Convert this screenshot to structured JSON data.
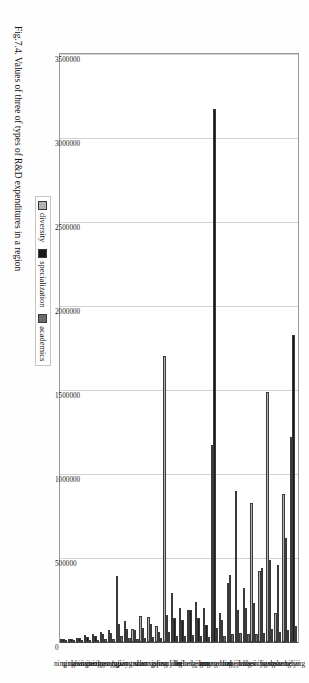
{
  "figure": {
    "caption": "Fig.7.4. Values of three of types of R&D expenditures in a region"
  },
  "legend": {
    "items": [
      {
        "label": "diversity",
        "color": "#b3b3b3"
      },
      {
        "label": "specialization",
        "color": "#1a1a1a"
      },
      {
        "label": "academics",
        "color": "#6b6b6b"
      }
    ]
  },
  "chart_data": {
    "type": "bar",
    "orientation": "horizontal",
    "title": "",
    "subtitle": "",
    "xlabel": "",
    "ylabel": "",
    "grid": true,
    "legend_position": "bottom-left",
    "xlim": [
      0,
      3500000
    ],
    "xticks": [
      "0",
      "500000",
      "1000000",
      "1500000",
      "2000000",
      "2500000",
      "3000000",
      "3500000"
    ],
    "xtick_values": [
      0,
      500000,
      1000000,
      1500000,
      2000000,
      2500000,
      3000000,
      3500000
    ],
    "categories": [
      "beijing",
      "shanghai",
      "shaanxi",
      "jiangsu",
      "sichuan",
      "liaoning",
      "hubei",
      "zhejiang",
      "tianjin",
      "anhui",
      "guangdong",
      "hunan",
      "henan",
      "heilongjiang",
      "hebei",
      "jilin",
      "shandong",
      "gansu",
      "chongqing",
      "shanxi",
      "yunnan",
      "jiangxi",
      "fujian",
      "guangxi",
      "neimenggu",
      "guizhou",
      "xinjiang",
      "hainan",
      "qinghai",
      "ningxia"
    ],
    "series": [
      {
        "name": "diversity",
        "color": "#b3b3b3",
        "values": [
          1220000,
          880000,
          175000,
          1490000,
          420000,
          830000,
          320000,
          900000,
          350000,
          175000,
          1170000,
          200000,
          240000,
          190000,
          200000,
          290000,
          1700000,
          95000,
          150000,
          155000,
          75000,
          125000,
          390000,
          70000,
          60000,
          45000,
          40000,
          25000,
          20000,
          20000
        ]
      },
      {
        "name": "specialization",
        "color": "#1a1a1a",
        "values": [
          1830000,
          620000,
          460000,
          490000,
          440000,
          230000,
          200000,
          190000,
          400000,
          130000,
          3170000,
          100000,
          140000,
          190000,
          130000,
          140000,
          160000,
          60000,
          110000,
          85000,
          70000,
          75000,
          110000,
          55000,
          45000,
          35000,
          30000,
          22000,
          17000,
          16000
        ]
      },
      {
        "name": "academics",
        "color": "#6b6b6b",
        "values": [
          95000,
          70000,
          60000,
          80000,
          55000,
          50000,
          45000,
          55000,
          45000,
          35000,
          85000,
          32000,
          38000,
          40000,
          33000,
          36000,
          58000,
          22000,
          30000,
          26000,
          20000,
          24000,
          34000,
          18000,
          16000,
          13000,
          11000,
          9000,
          7000,
          7000
        ]
      }
    ]
  }
}
